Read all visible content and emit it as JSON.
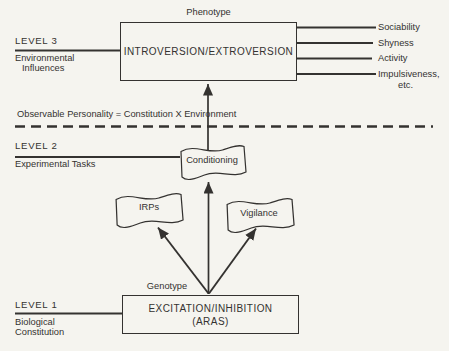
{
  "diagram": {
    "colors": {
      "ink": "#343230",
      "background": "#f5f4ef"
    },
    "phenotype_label": "Phenotype",
    "genotype_label": "Genotype",
    "introversion_box": "INTROVERSION/EXTROVERSION",
    "excitation_box_line1": "EXCITATION/INHIBITION",
    "excitation_box_line2": "(ARAS)",
    "conditioning_label": "Conditioning",
    "irps_label": "IRPs",
    "vigilance_label": "Vigilance",
    "equation": "Observable Personality = Constitution X Environment",
    "traits": [
      "Sociability",
      "Shyness",
      "Activity",
      "Impulsiveness,",
      "etc."
    ],
    "levels": {
      "level3": {
        "title": "LEVEL 3",
        "line1": "Environmental",
        "line2": "Influences"
      },
      "level2": {
        "title": "LEVEL 2",
        "line1": "Experimental Tasks"
      },
      "level1": {
        "title": "LEVEL 1",
        "line1": "Biological",
        "line2": "Constitution"
      }
    }
  }
}
